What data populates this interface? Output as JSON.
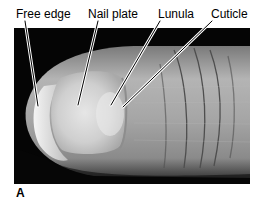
{
  "figure": {
    "panel_letter": "A",
    "labels": [
      {
        "text": "Free edge",
        "x": 16
      },
      {
        "text": "Nail plate",
        "x": 88
      },
      {
        "text": "Lunula",
        "x": 158
      },
      {
        "text": "Cuticle",
        "x": 211
      }
    ]
  },
  "colors": {
    "background": "#050505",
    "skin_light": "#d8d8d8",
    "skin_mid": "#a8a8a8",
    "skin_dark": "#6a6a6a",
    "nail": "#dcdcdc",
    "crease": "#4a4a4a"
  }
}
